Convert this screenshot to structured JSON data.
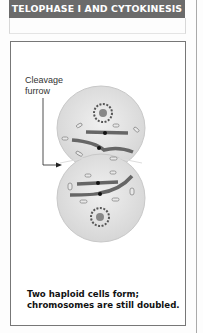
{
  "header": {
    "title": "TELOPHASE I AND CYTOKINESIS",
    "background": "#6b6b6b"
  },
  "diagram": {
    "label_line1": "Cleavage",
    "label_line2": "furrow",
    "caption_line1": "Two haploid cells form;",
    "caption_line2": "chromosomes are still doubled."
  }
}
